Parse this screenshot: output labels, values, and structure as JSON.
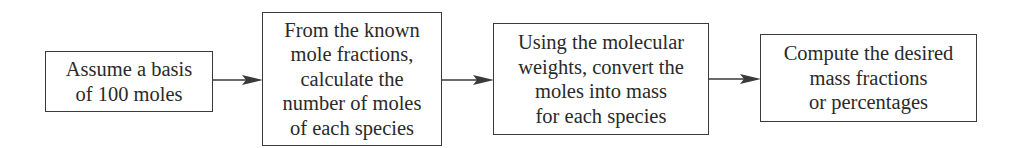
{
  "diagram": {
    "type": "flowchart",
    "direction": "left-to-right",
    "colors": {
      "stroke": "#3a3a3a",
      "text": "#2a2a2a",
      "background": "#ffffff"
    },
    "steps": [
      {
        "id": "step-1",
        "lines": [
          "Assume a basis",
          "of 100 moles"
        ]
      },
      {
        "id": "step-2",
        "lines": [
          "From the known",
          "mole fractions,",
          "calculate the",
          "number of moles",
          "of each species"
        ]
      },
      {
        "id": "step-3",
        "lines": [
          "Using the molecular",
          "weights, convert the",
          "moles into mass",
          "for each species"
        ]
      },
      {
        "id": "step-4",
        "lines": [
          "Compute the desired",
          "mass fractions",
          "or percentages"
        ]
      }
    ],
    "edges": [
      {
        "from": "step-1",
        "to": "step-2"
      },
      {
        "from": "step-2",
        "to": "step-3"
      },
      {
        "from": "step-3",
        "to": "step-4"
      }
    ]
  }
}
